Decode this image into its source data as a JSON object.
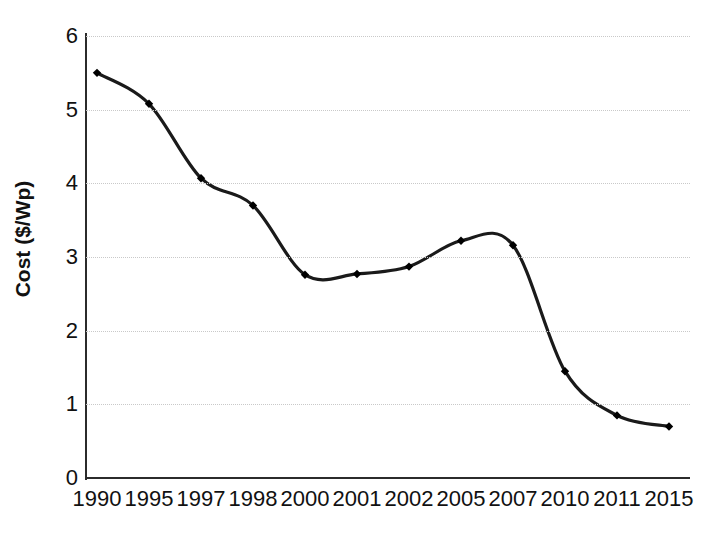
{
  "chart_data": {
    "type": "line",
    "title": "",
    "xlabel": "",
    "ylabel": "Cost ($/Wp)",
    "categories": [
      "1990",
      "1995",
      "1997",
      "1998",
      "2000",
      "2001",
      "2002",
      "2005",
      "2007",
      "2010",
      "2011",
      "2015"
    ],
    "values": [
      5.5,
      5.08,
      4.07,
      3.7,
      2.76,
      2.77,
      2.87,
      3.22,
      3.16,
      1.45,
      0.85,
      0.7
    ],
    "series": [
      {
        "name": "Cost ($/Wp)",
        "values": [
          5.5,
          5.08,
          4.07,
          3.7,
          2.76,
          2.77,
          2.87,
          3.22,
          3.16,
          1.45,
          0.85,
          0.7
        ]
      }
    ],
    "ylim": [
      0,
      6
    ],
    "y_ticks": [
      0,
      1,
      2,
      3,
      4,
      5,
      6
    ],
    "y_tick_labels": [
      "0",
      "1",
      "2",
      "3",
      "4",
      "5",
      "6"
    ],
    "grid": true,
    "grid_axis": "y",
    "grid_style": "dotted",
    "legend": false,
    "legend_position": "none",
    "marker": "diamond",
    "line_style": "smooth-spline",
    "colors": {
      "line": "#1a1a1a",
      "marker": "#000000",
      "grid": "#c9c9c9",
      "axis": "#2b2b2b",
      "text": "#111111",
      "background": "#ffffff"
    }
  }
}
